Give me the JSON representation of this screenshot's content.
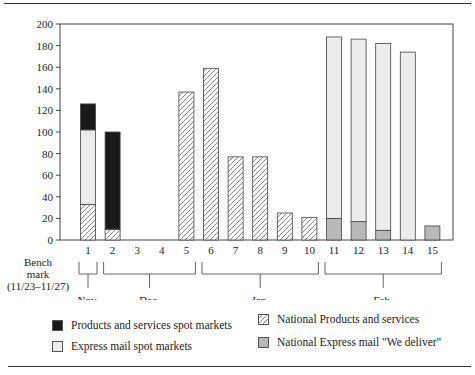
{
  "chart_data": {
    "type": "bar",
    "stacked": true,
    "title": "",
    "xlabel": "",
    "ylabel": "",
    "ylim": [
      0,
      200
    ],
    "yticks": [
      0,
      20,
      40,
      60,
      80,
      100,
      120,
      140,
      160,
      180,
      200
    ],
    "categories": [
      "1",
      "2",
      "3",
      "4",
      "5",
      "6",
      "7",
      "8",
      "9",
      "10",
      "11",
      "12",
      "13",
      "14",
      "15"
    ],
    "benchmark_label": [
      "Bench",
      "mark",
      "(11/23–11/27)"
    ],
    "month_groups": [
      {
        "label": "Nov.",
        "from": 1,
        "to": 1
      },
      {
        "label": "Dec.",
        "from": 2,
        "to": 5
      },
      {
        "label": "Jan.",
        "from": 6,
        "to": 10
      },
      {
        "label": "Feb.",
        "from": 11,
        "to": 15
      }
    ],
    "series": [
      {
        "name": "National Products and services",
        "pattern": "hatched",
        "color": "#ffffff",
        "values": [
          33,
          10,
          0,
          0,
          137,
          159,
          77,
          77,
          25,
          21,
          0,
          0,
          0,
          0,
          0
        ]
      },
      {
        "name": "National Express mail \"We deliver\"",
        "pattern": "solid",
        "color": "#b8b8b8",
        "values": [
          0,
          0,
          0,
          0,
          0,
          0,
          0,
          0,
          0,
          0,
          20,
          17,
          9,
          0,
          13
        ]
      },
      {
        "name": "Express mail spot markets",
        "pattern": "solid",
        "color": "#ececec",
        "values": [
          69,
          0,
          0,
          0,
          0,
          0,
          0,
          0,
          0,
          0,
          168,
          169,
          173,
          174,
          0
        ]
      },
      {
        "name": "Products and services spot markets",
        "pattern": "solid",
        "color": "#1a1a1a",
        "values": [
          24,
          90,
          0,
          0,
          0,
          0,
          0,
          0,
          0,
          0,
          0,
          0,
          0,
          0,
          0
        ]
      }
    ],
    "grid": false,
    "legend_position": "bottom"
  },
  "legend": [
    {
      "label": "Products and services spot markets",
      "swatch": "black"
    },
    {
      "label": "Express mail spot markets",
      "swatch": "light-gray"
    },
    {
      "label": "National Products and services",
      "swatch": "hatched"
    },
    {
      "label": "National Express mail \"We deliver\"",
      "swatch": "dark-gray"
    }
  ]
}
